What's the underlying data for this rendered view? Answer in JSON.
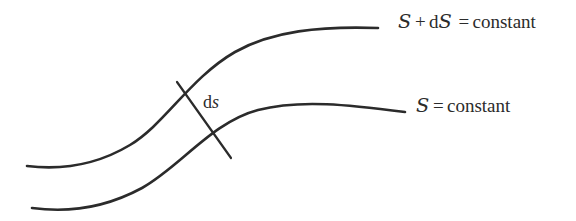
{
  "figure": {
    "type": "diagram",
    "background_color": "#ffffff",
    "stroke_color": "#2b2b2b",
    "text_color": "#2b2b2b",
    "labels": {
      "upper_curve": {
        "symbol": "S",
        "plus": "+",
        "differential_prefix": "d",
        "differential_symbol": "S",
        "equals": "=",
        "value": "constant",
        "full_text": "S + dS  = constant"
      },
      "lower_curve": {
        "symbol": "S",
        "equals": "=",
        "value": "constant",
        "full_text": "S = constant"
      },
      "separation": {
        "prefix": "d",
        "symbol": "s",
        "full_text": "ds"
      }
    },
    "geometry": {
      "upper_curve": {
        "path": "M 27 166 C 60 170, 95 166, 130 145 C 165 124, 190 78, 235 52 C 272 31, 320 26, 378 28",
        "stroke_width": 2.6
      },
      "lower_curve": {
        "path": "M 32 208 C 68 213, 105 208, 142 188 C 180 167, 212 122, 258 110 C 300 99, 350 105, 405 112",
        "stroke_width": 2.6
      },
      "separation_tick": {
        "x1": 177,
        "y1": 82,
        "x2": 231,
        "y2": 158,
        "stroke_width": 2.2
      }
    }
  }
}
